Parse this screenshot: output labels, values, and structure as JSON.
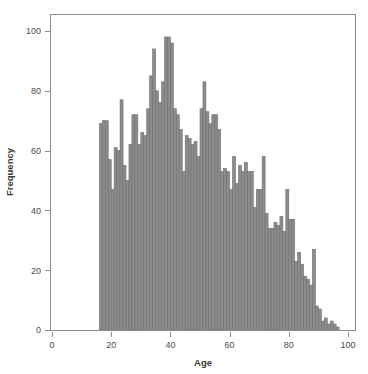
{
  "chart_data": {
    "type": "bar",
    "title": "",
    "subtitle": "",
    "xlabel": "Age",
    "ylabel": "Frequency",
    "xlim": [
      0,
      100
    ],
    "ylim": [
      0,
      104
    ],
    "grid": false,
    "legend": null,
    "bin_width": 1,
    "x_ticks": [
      0,
      20,
      40,
      60,
      80,
      100
    ],
    "y_ticks": [
      0,
      20,
      40,
      60,
      80,
      100
    ],
    "x_tick_labels": [
      "0",
      "20",
      "40",
      "60",
      "80",
      "100"
    ],
    "y_tick_labels": [
      "0",
      "20",
      "40",
      "60",
      "80",
      "100"
    ],
    "bar_color": "#8c8c8c",
    "bar_edge_color": "#6e6e6e",
    "axis_color": "#8c8c8c",
    "categories": [
      16,
      17,
      18,
      19,
      20,
      21,
      22,
      23,
      24,
      25,
      26,
      27,
      28,
      29,
      30,
      31,
      32,
      33,
      34,
      35,
      36,
      37,
      38,
      39,
      40,
      41,
      42,
      43,
      44,
      45,
      46,
      47,
      48,
      49,
      50,
      51,
      52,
      53,
      54,
      55,
      56,
      57,
      58,
      59,
      60,
      61,
      62,
      63,
      64,
      65,
      66,
      67,
      68,
      69,
      70,
      71,
      72,
      73,
      74,
      75,
      76,
      77,
      78,
      79,
      80,
      81,
      82,
      83,
      84,
      85,
      86,
      87,
      88,
      89,
      90,
      91,
      92,
      93,
      94,
      95,
      96
    ],
    "values": [
      69,
      70,
      70,
      57,
      47,
      61,
      60,
      77,
      55,
      50,
      62,
      72,
      72,
      62,
      66,
      65,
      74,
      85,
      94,
      80,
      76,
      83,
      98,
      98,
      96,
      74,
      72,
      67,
      53,
      65,
      64,
      62,
      63,
      58,
      74,
      83,
      73,
      69,
      72,
      72,
      67,
      53,
      54,
      53,
      47,
      58,
      49,
      55,
      53,
      56,
      53,
      53,
      41,
      47,
      47,
      58,
      39,
      34,
      34,
      36,
      35,
      38,
      33,
      47,
      37,
      37,
      23,
      26,
      22,
      18,
      17,
      15,
      27,
      8,
      7,
      3,
      4,
      2,
      3,
      2,
      1
    ]
  }
}
